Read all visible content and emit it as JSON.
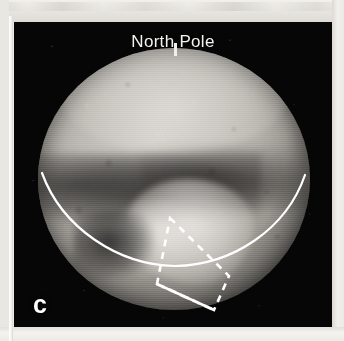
{
  "figure": {
    "panel_letter": "c",
    "background_color": "#050505",
    "plate_border_color": "#e9e7e2",
    "annotation_color": "#ffffff",
    "labels": [
      {
        "name": "north-pole-label",
        "text": "North Pole",
        "color": "#f3f2ef",
        "tick_mark": "|"
      }
    ],
    "annotations": [
      {
        "name": "equator-arc",
        "type": "solid-curve",
        "style": "solid",
        "color": "#ffffff",
        "description": "solid white arc marking the equator across the lower hemisphere"
      },
      {
        "name": "region-of-interest-box",
        "type": "quadrilateral",
        "style": "dashed",
        "color": "#ffffff",
        "description": "dashed white quadrilateral outlining a surface region of interest"
      }
    ],
    "surface_features": [
      {
        "name": "north-polar-cap",
        "tone": "bright"
      },
      {
        "name": "equatorial-dark-belt",
        "tone": "dark"
      },
      {
        "name": "sputnik-planitia-heart",
        "tone": "bright"
      }
    ]
  }
}
